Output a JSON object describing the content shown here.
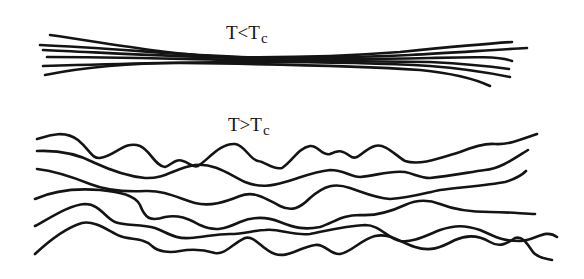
{
  "diagram": {
    "panels": [
      {
        "id": "ordered",
        "label": {
          "main": "T<T",
          "subscript": "c"
        },
        "description": "aligned bundle of chains below critical temperature",
        "chain_count": 6,
        "chains": [
          "M 50 35 C 120 45, 170 55, 230 57 C 300 58, 360 55, 400 52 C 440 48, 480 44, 512 42",
          "M 40 45 C 110 48, 180 55, 240 57 C 300 59, 360 57, 410 55 C 450 53, 490 50, 527 48",
          "M 43 50 C 110 53, 180 57, 240 58 C 300 59, 380 59, 430 58 C 470 57, 500 56, 512 61",
          "M 47 57 C 110 57, 180 59, 240 60 C 300 61, 380 61, 430 62 C 470 64, 495 67, 509 69",
          "M 43 66 C 110 64, 180 62, 240 62 C 300 62, 380 63, 430 66 C 470 69, 495 74, 510 77",
          "M 45 75 C 80 68, 120 63, 180 63 C 260 64, 360 66, 420 70 C 450 73, 475 79, 490 86"
        ]
      },
      {
        "id": "disordered",
        "label": {
          "main": "T>T",
          "subscript": "c"
        },
        "description": "randomly wavy chains above critical temperature",
        "chain_count": 6,
        "chains": [
          "M 37 139 C 50 135, 65 130, 78 140 C 90 150, 92 159, 100 158 C 115 156, 125 140, 140 146 C 150 150, 155 166, 165 167 C 172 165, 175 158, 183 161 C 190 163, 192 168, 198 166 C 208 160, 220 143, 235 144 C 245 145, 250 160, 258 161 C 266 162, 272 170, 282 168 C 292 162, 298 148, 310 146 C 318 145, 322 156, 330 154 C 338 150, 342 150, 350 156 C 358 162, 362 150, 375 146 C 385 143, 395 155, 405 161 C 420 166, 440 158, 460 152 C 475 146, 485 143, 495 144 C 510 145, 525 138, 537 134",
          "M 37 151 C 60 150, 80 155, 95 163 C 110 170, 125 176, 145 178 C 165 179, 175 168, 195 165 C 215 163, 230 175, 245 182 C 260 188, 272 186, 285 182 C 300 178, 312 172, 330 170 C 345 170, 350 177, 360 177 C 375 176, 390 170, 405 172 C 415 174, 420 178, 430 178 C 450 176, 470 172, 485 170 C 500 169, 515 158, 528 150",
          "M 37 169 C 55 171, 75 178, 90 184 C 105 190, 125 192, 145 191 C 165 190, 180 199, 195 203 C 210 207, 225 202, 240 196 C 255 190, 268 200, 280 206 C 292 212, 300 208, 310 198 C 325 185, 335 183, 350 188 C 365 193, 375 198, 390 199 C 410 198, 425 193, 440 190 C 465 187, 490 185, 505 182 C 515 179, 522 175, 526 171",
          "M 35 199 C 55 190, 75 188, 100 190 C 120 192, 135 195, 140 205 C 145 218, 150 222, 165 217 C 180 214, 190 220, 200 225 C 215 232, 225 229, 240 222 C 252 217, 265 216, 280 222 C 295 228, 305 230, 320 227 C 335 222, 342 215, 360 215 C 375 216, 390 212, 405 205 C 418 199, 430 200, 440 204 C 455 210, 470 212, 490 212 C 510 212, 525 214, 535 214",
          "M 35 226 C 55 215, 70 205, 85 204 C 100 204, 105 218, 115 222 C 125 226, 140 224, 155 228 C 170 234, 175 239, 190 238 C 205 237, 215 234, 230 234 C 245 234, 255 230, 265 230 C 280 228, 290 236, 310 234 C 330 230, 345 226, 365 225 C 380 225, 387 238, 400 241 C 412 243, 425 236, 440 230 C 455 225, 465 225, 480 230 C 495 236, 500 241, 520 241 C 535 241, 545 228, 557 237",
          "M 35 254 C 50 240, 65 228, 82 223 C 95 220, 110 232, 120 236 C 130 240, 145 238, 152 246 C 158 252, 170 253, 180 251 C 195 248, 205 250, 215 253 C 225 255, 232 244, 245 238 C 255 235, 262 250, 275 254 C 288 258, 298 248, 315 245 C 325 243, 330 255, 340 254 C 352 252, 360 240, 375 236 C 390 233, 400 242, 415 247 C 430 252, 440 248, 455 240 C 468 234, 480 236, 490 242 C 500 248, 508 243, 515 238 C 525 235, 530 250, 535 254 C 540 258, 546 259, 552 260"
        ]
      }
    ],
    "colors": {
      "line": "#141414",
      "text": "#111111",
      "background": "#ffffff"
    }
  }
}
